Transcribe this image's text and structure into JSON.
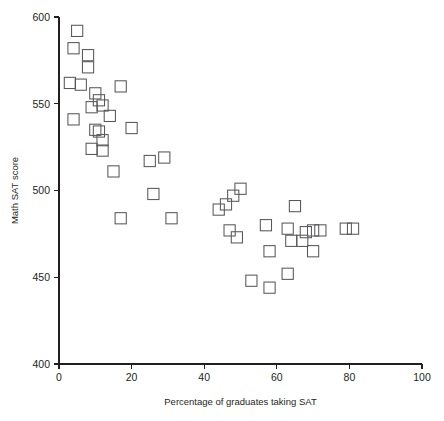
{
  "chart_data": {
    "type": "scatter",
    "title": "",
    "xlabel": "Percentage of graduates taking SAT",
    "ylabel": "Math SAT score",
    "xlim": [
      0,
      100
    ],
    "ylim": [
      400,
      600
    ],
    "xticks": [
      0,
      20,
      40,
      60,
      80,
      100
    ],
    "yticks": [
      400,
      450,
      500,
      550,
      600
    ],
    "xtick_labels": [
      "0",
      "20",
      "40",
      "60",
      "80",
      "100"
    ],
    "ytick_labels": [
      "400",
      "450",
      "500",
      "550",
      "600"
    ],
    "grid": false,
    "legend": false,
    "marker": "open-square",
    "marker_color": "#58585b",
    "axis_color": "#231f20",
    "points": [
      {
        "x": 5,
        "y": 592
      },
      {
        "x": 4,
        "y": 582
      },
      {
        "x": 8,
        "y": 578
      },
      {
        "x": 8,
        "y": 571
      },
      {
        "x": 3,
        "y": 562
      },
      {
        "x": 6,
        "y": 561
      },
      {
        "x": 17,
        "y": 560
      },
      {
        "x": 10,
        "y": 556
      },
      {
        "x": 11,
        "y": 552
      },
      {
        "x": 12,
        "y": 549
      },
      {
        "x": 9,
        "y": 548
      },
      {
        "x": 14,
        "y": 543
      },
      {
        "x": 4,
        "y": 541
      },
      {
        "x": 20,
        "y": 536
      },
      {
        "x": 10,
        "y": 535
      },
      {
        "x": 11,
        "y": 534
      },
      {
        "x": 12,
        "y": 529
      },
      {
        "x": 9,
        "y": 524
      },
      {
        "x": 12,
        "y": 523
      },
      {
        "x": 15,
        "y": 511
      },
      {
        "x": 25,
        "y": 517
      },
      {
        "x": 29,
        "y": 519
      },
      {
        "x": 26,
        "y": 498
      },
      {
        "x": 17,
        "y": 484
      },
      {
        "x": 31,
        "y": 484
      },
      {
        "x": 50,
        "y": 501
      },
      {
        "x": 48,
        "y": 497
      },
      {
        "x": 46,
        "y": 492
      },
      {
        "x": 44,
        "y": 489
      },
      {
        "x": 47,
        "y": 477
      },
      {
        "x": 49,
        "y": 473
      },
      {
        "x": 57,
        "y": 480
      },
      {
        "x": 63,
        "y": 478
      },
      {
        "x": 65,
        "y": 491
      },
      {
        "x": 68,
        "y": 476
      },
      {
        "x": 70,
        "y": 477
      },
      {
        "x": 72,
        "y": 477
      },
      {
        "x": 64,
        "y": 471
      },
      {
        "x": 67,
        "y": 471
      },
      {
        "x": 70,
        "y": 465
      },
      {
        "x": 79,
        "y": 478
      },
      {
        "x": 81,
        "y": 478
      },
      {
        "x": 58,
        "y": 465
      },
      {
        "x": 63,
        "y": 452
      },
      {
        "x": 53,
        "y": 448
      },
      {
        "x": 58,
        "y": 444
      }
    ]
  }
}
